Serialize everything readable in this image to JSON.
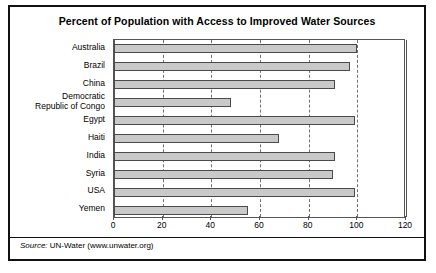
{
  "figure": {
    "title": "Percent of Population with Access to Improved Water Sources",
    "source_label": "Source:",
    "source_text": " UN-Water (www.unwater.org)",
    "border_color": "#111111",
    "bar_fill": "#c9c9c9",
    "bar_stroke": "#4a4a4a",
    "grid_color": "#707070"
  },
  "chart_data": {
    "type": "bar",
    "orientation": "horizontal",
    "title": "Percent of Population with Access to Improved Water Sources",
    "xlabel": "",
    "ylabel": "",
    "xlim": [
      0,
      120
    ],
    "ylim": null,
    "grid": true,
    "legend": null,
    "xticks": [
      0,
      20,
      40,
      60,
      80,
      100,
      120
    ],
    "xtick_labels": [
      "0",
      "20",
      "40",
      "60",
      "80",
      "100",
      "120"
    ],
    "categories": [
      "Australia",
      "Brazil",
      "China",
      "Democratic\nRepublic of Congo",
      "Egypt",
      "Haiti",
      "India",
      "Syria",
      "USA",
      "Yemen"
    ],
    "values": [
      100,
      97,
      91,
      48,
      99,
      68,
      91,
      90,
      99,
      55
    ],
    "series": [
      {
        "name": "Percent of population with access to improved water sources",
        "values": [
          100,
          97,
          91,
          48,
          99,
          68,
          91,
          90,
          99,
          55
        ]
      }
    ]
  }
}
